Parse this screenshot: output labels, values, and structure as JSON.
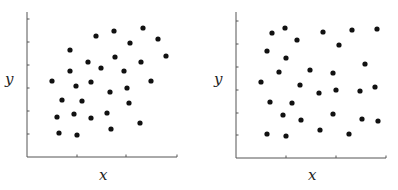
{
  "chart_data": [
    {
      "type": "scatter",
      "title": "",
      "xlabel": "x",
      "ylabel": "y",
      "grid": false,
      "legend": null,
      "tick_labels": false,
      "description": "Positively correlated scatter",
      "points": [
        {
          "x": 143,
          "y": 28
        },
        {
          "x": 114,
          "y": 31
        },
        {
          "x": 96,
          "y": 36
        },
        {
          "x": 158,
          "y": 39
        },
        {
          "x": 130,
          "y": 43
        },
        {
          "x": 70,
          "y": 50
        },
        {
          "x": 166,
          "y": 56
        },
        {
          "x": 115,
          "y": 57
        },
        {
          "x": 88,
          "y": 62
        },
        {
          "x": 141,
          "y": 62
        },
        {
          "x": 101,
          "y": 68
        },
        {
          "x": 70,
          "y": 71
        },
        {
          "x": 124,
          "y": 71
        },
        {
          "x": 52,
          "y": 81
        },
        {
          "x": 151,
          "y": 81
        },
        {
          "x": 91,
          "y": 82
        },
        {
          "x": 76,
          "y": 86
        },
        {
          "x": 127,
          "y": 88
        },
        {
          "x": 110,
          "y": 92
        },
        {
          "x": 62,
          "y": 100
        },
        {
          "x": 82,
          "y": 101
        },
        {
          "x": 129,
          "y": 103
        },
        {
          "x": 57,
          "y": 117
        },
        {
          "x": 74,
          "y": 114
        },
        {
          "x": 91,
          "y": 118
        },
        {
          "x": 107,
          "y": 113
        },
        {
          "x": 140,
          "y": 123
        },
        {
          "x": 111,
          "y": 129
        },
        {
          "x": 59,
          "y": 133
        },
        {
          "x": 77,
          "y": 135
        }
      ],
      "axis": {
        "origin": [
          27,
          157
        ],
        "x_end": 177,
        "y_end": 12,
        "x_ticks": [
          77,
          126,
          177
        ],
        "y_ticks": [
          19,
          42,
          65,
          88,
          111,
          134
        ]
      }
    },
    {
      "type": "scatter",
      "title": "",
      "xlabel": "x",
      "ylabel": "y",
      "grid": false,
      "legend": null,
      "tick_labels": false,
      "description": "Uncorrelated scatter",
      "points": [
        {
          "x": 285,
          "y": 28
        },
        {
          "x": 272,
          "y": 33
        },
        {
          "x": 323,
          "y": 32
        },
        {
          "x": 352,
          "y": 30
        },
        {
          "x": 377,
          "y": 29
        },
        {
          "x": 297,
          "y": 40
        },
        {
          "x": 339,
          "y": 45
        },
        {
          "x": 267,
          "y": 51
        },
        {
          "x": 286,
          "y": 58
        },
        {
          "x": 365,
          "y": 64
        },
        {
          "x": 279,
          "y": 72
        },
        {
          "x": 310,
          "y": 70
        },
        {
          "x": 333,
          "y": 73
        },
        {
          "x": 261,
          "y": 82
        },
        {
          "x": 300,
          "y": 85
        },
        {
          "x": 319,
          "y": 93
        },
        {
          "x": 336,
          "y": 90
        },
        {
          "x": 360,
          "y": 91
        },
        {
          "x": 375,
          "y": 87
        },
        {
          "x": 270,
          "y": 102
        },
        {
          "x": 292,
          "y": 103
        },
        {
          "x": 283,
          "y": 115
        },
        {
          "x": 301,
          "y": 120
        },
        {
          "x": 333,
          "y": 114
        },
        {
          "x": 362,
          "y": 119
        },
        {
          "x": 378,
          "y": 121
        },
        {
          "x": 267,
          "y": 134
        },
        {
          "x": 286,
          "y": 136
        },
        {
          "x": 320,
          "y": 130
        },
        {
          "x": 349,
          "y": 134
        }
      ],
      "axis": {
        "origin": [
          236,
          158
        ],
        "x_end": 386,
        "y_end": 12,
        "x_ticks": [
          286,
          336,
          386
        ],
        "y_ticks": [
          21,
          44,
          67,
          90,
          113,
          135
        ]
      }
    }
  ],
  "colors": {
    "axis": "#555555",
    "dot": "#111111",
    "label": "#222222"
  }
}
